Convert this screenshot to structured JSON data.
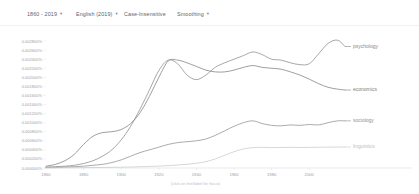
{
  "toolbar": {
    "date_range": "1860 - 2019",
    "corpus": "English (2019)",
    "case_insensitive": "Case-Insensitive",
    "smoothing": "Smoothing",
    "caret": "▾"
  },
  "chart_data": {
    "type": "line",
    "title": "",
    "xlabel": "",
    "ylabel": "",
    "caption": "(click on line/label for focus)",
    "xlim": [
      1860,
      2019
    ],
    "ylim": [
      0.0,
      0.003
    ],
    "grid": false,
    "legend_position": "right",
    "xticks": [
      1860,
      1880,
      1900,
      1920,
      1940,
      1960,
      1980,
      2000
    ],
    "yticks": [
      "0.000000%",
      "0.000200%",
      "0.000400%",
      "0.000600%",
      "0.000800%",
      "0.001000%",
      "0.001200%",
      "0.001400%",
      "0.001600%",
      "0.001800%",
      "0.002000%",
      "0.002200%",
      "0.002400%",
      "0.002600%",
      "0.002800%"
    ],
    "ytick_values": [
      0.0,
      0.0002,
      0.0004,
      0.0006,
      0.0008,
      0.001,
      0.0012,
      0.0014,
      0.0016,
      0.0018,
      0.002,
      0.0022,
      0.0024,
      0.0026,
      0.0028
    ],
    "x": [
      1860,
      1865,
      1870,
      1875,
      1880,
      1885,
      1890,
      1895,
      1900,
      1905,
      1910,
      1915,
      1920,
      1925,
      1930,
      1935,
      1940,
      1945,
      1950,
      1955,
      1960,
      1965,
      1970,
      1975,
      1980,
      1985,
      1990,
      1995,
      2000,
      2005,
      2010,
      2015,
      2019
    ],
    "series": [
      {
        "name": "psychology",
        "color": "#8a8a8a",
        "label_color": "#8a8a8a",
        "values": [
          2e-05,
          3e-05,
          4e-05,
          6e-05,
          0.0001,
          0.00016,
          0.00026,
          0.0004,
          0.00062,
          0.00092,
          0.0013,
          0.00172,
          0.00215,
          0.00238,
          0.0023,
          0.00205,
          0.00195,
          0.00205,
          0.00222,
          0.00232,
          0.0024,
          0.00248,
          0.00256,
          0.0025,
          0.0024,
          0.00238,
          0.00232,
          0.00228,
          0.0023,
          0.00252,
          0.00275,
          0.00282,
          0.00268
        ]
      },
      {
        "name": "economics",
        "color": "#7d7d7d",
        "label_color": "#7d7d7d",
        "values": [
          4e-05,
          8e-05,
          0.00016,
          0.0003,
          0.00052,
          0.0007,
          0.00078,
          0.0008,
          0.00085,
          0.00098,
          0.00122,
          0.00158,
          0.002,
          0.00236,
          0.00238,
          0.00232,
          0.00224,
          0.00216,
          0.00212,
          0.00212,
          0.00216,
          0.00222,
          0.00226,
          0.00222,
          0.0022,
          0.00218,
          0.00212,
          0.00205,
          0.00196,
          0.00186,
          0.00178,
          0.00174,
          0.00172
        ]
      },
      {
        "name": "sociology",
        "color": "#8f8f8f",
        "label_color": "#8f8f8f",
        "values": [
          1e-05,
          1e-05,
          2e-05,
          3e-05,
          4e-05,
          6e-05,
          8e-05,
          0.00012,
          0.00018,
          0.00026,
          0.00034,
          0.0004,
          0.00046,
          0.00052,
          0.00056,
          0.00058,
          0.0006,
          0.00064,
          0.00072,
          0.00082,
          0.00092,
          0.001,
          0.00104,
          0.00098,
          0.00094,
          0.00093,
          0.00095,
          0.00094,
          0.00096,
          0.00095,
          0.001,
          0.00104,
          0.00104
        ]
      },
      {
        "name": "linguistics",
        "color": "#c9c9c9",
        "label_color": "#bdbdbd",
        "values": [
          5e-06,
          5e-06,
          6e-06,
          7e-06,
          8e-06,
          1e-05,
          1.2e-05,
          1.4e-05,
          1.8e-05,
          2.2e-05,
          2.8e-05,
          3.4e-05,
          4.2e-05,
          5.2e-05,
          6.6e-05,
          8.2e-05,
          0.000105,
          0.00014,
          0.0002,
          0.00028,
          0.00036,
          0.00042,
          0.00045,
          0.000455,
          0.00045,
          0.000452,
          0.000455,
          0.000452,
          0.000455,
          0.000458,
          0.00046,
          0.000462,
          0.000462
        ]
      }
    ]
  }
}
